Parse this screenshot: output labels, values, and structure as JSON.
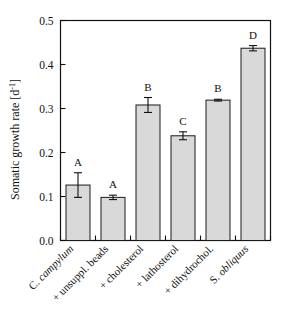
{
  "chart_data": {
    "type": "bar",
    "title": "",
    "subtitle": "",
    "xlabel": "",
    "ylabel": "Somatic growth rate [d⁻¹]",
    "ylabel_parts": {
      "text": "Somatic growth rate [d",
      "superscript": "-1",
      "tail": "]"
    },
    "ylim": [
      0.0,
      0.5
    ],
    "ytick_labels": [
      "0.0",
      "0.1",
      "0.2",
      "0.3",
      "0.4",
      "0.5"
    ],
    "ytick_values": [
      0.0,
      0.1,
      0.2,
      0.3,
      0.4,
      0.5
    ],
    "grid": false,
    "legend": "none",
    "categories": [
      "C. campylum",
      "+ unsuppl. beads",
      "+ cholesterol",
      "+ lathosterol",
      "+ dihydrochol.",
      "S. obliquus"
    ],
    "category_italic": [
      true,
      false,
      false,
      false,
      false,
      true
    ],
    "values": [
      0.126,
      0.098,
      0.308,
      0.238,
      0.319,
      0.437
    ],
    "errors": [
      0.028,
      0.005,
      0.017,
      0.009,
      0.002,
      0.006
    ],
    "annotations": [
      "A",
      "A",
      "B",
      "C",
      "B",
      "D"
    ],
    "bar_fill_color": "#d9d9d9",
    "bar_edge_color": "#1a1a1a",
    "error_color": "#111111"
  },
  "figure": {
    "background_color": "#ffffff",
    "frame_color": "#111111"
  }
}
